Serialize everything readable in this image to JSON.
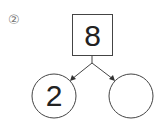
{
  "problem": {
    "label": "②",
    "top_value": "8",
    "left_value": "2",
    "right_value": ""
  },
  "colors": {
    "stroke": "#333333",
    "text": "#222222"
  }
}
